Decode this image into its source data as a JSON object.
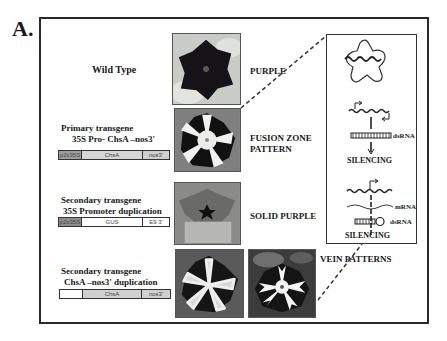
{
  "figure": {
    "panel_label": "A.",
    "rows": [
      {
        "title": "Wild Type",
        "phenotype": "PURPLE",
        "construct": null
      },
      {
        "title_line1": "Primary transgene",
        "title_line2": "35S Pro- ChsA –nos3'",
        "phenotype_line1": "FUSION ZONE",
        "phenotype_line2": "PATTERN",
        "construct": [
          "p2x35S",
          "ChsA",
          "nos3'"
        ]
      },
      {
        "title_line1": "Secondary transgene",
        "title_line2": "35S Promoter duplication",
        "phenotype": "SOLID PURPLE",
        "construct": [
          "p2x35S",
          "GUS",
          "E9 3'"
        ]
      },
      {
        "title_line1": "Secondary transgene",
        "title_line2": "ChsA –nos3' duplication",
        "phenotype": "VEIN PATTERNS",
        "construct": [
          "",
          "ChsA",
          "nos3'"
        ]
      }
    ],
    "mechanism": {
      "upper": {
        "dsrna_label": "dsRNA",
        "result": "SILENCING"
      },
      "lower": {
        "mrna_label": "mRNA",
        "dsrna_label": "dsRNA",
        "result": "SILENCING"
      }
    },
    "photos": [
      {
        "name": "wild-type-purple-flower"
      },
      {
        "name": "fusion-zone-pattern-flower"
      },
      {
        "name": "solid-purple-flower"
      },
      {
        "name": "vein-pattern-flower-1"
      },
      {
        "name": "vein-pattern-flower-2"
      }
    ]
  }
}
